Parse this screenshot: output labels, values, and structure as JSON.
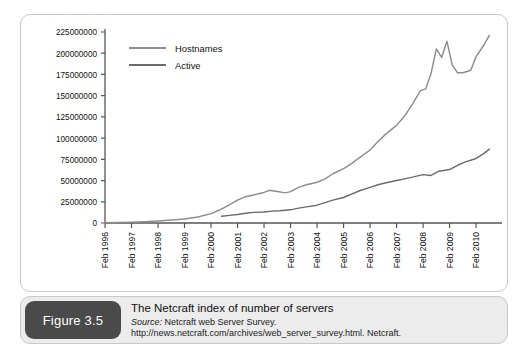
{
  "figure": {
    "badge_label": "Figure 3.5",
    "title": "The Netcraft index of number of servers",
    "source_label": "Source:",
    "source_text": " Netcraft web Server Survey. http://news.netcraft.com/archives/web_server_survey.html. Netcraft."
  },
  "colors": {
    "hostnames_line": "#8d8d8d",
    "active_line": "#6b6b6b",
    "axis": "#555555",
    "panel_border": "#c8c8c8",
    "badge_bg": "#4a4a4a",
    "caption_bg": "#ececec",
    "text": "#1a1a1a"
  },
  "chart_data": {
    "type": "line",
    "title": "The Netcraft index of number of servers",
    "xlabel": "",
    "ylabel": "",
    "grid": false,
    "legend_position": "top-left",
    "ylim": [
      0,
      225000000
    ],
    "yticks": [
      0,
      25000000,
      50000000,
      75000000,
      100000000,
      125000000,
      150000000,
      175000000,
      200000000,
      225000000
    ],
    "ytick_labels": [
      "0",
      "25000000",
      "50000000",
      "75000000",
      "100000000",
      "125000000",
      "150000000",
      "175000000",
      "200000000",
      "225000000"
    ],
    "xticks": [
      "Feb 1996",
      "Feb 1997",
      "Feb 1998",
      "Feb 1999",
      "Feb 2000",
      "Feb 2001",
      "Feb 2002",
      "Feb 2003",
      "Feb 2004",
      "Feb 2005",
      "Feb 2006",
      "Feb 2007",
      "Feb 2008",
      "Feb 2009",
      "Feb 2010"
    ],
    "xlim": [
      "Feb 1996",
      "Aug 2010"
    ],
    "series": [
      {
        "name": "Hostnames",
        "color": "#8d8d8d",
        "x": [
          1996.1,
          1996.6,
          1997.1,
          1997.6,
          1998.1,
          1998.6,
          1999.1,
          1999.6,
          2000.1,
          2000.4,
          2000.7,
          2001.1,
          2001.4,
          2001.7,
          2002.1,
          2002.3,
          2002.6,
          2002.9,
          2003.1,
          2003.4,
          2003.7,
          2004.1,
          2004.4,
          2004.7,
          2005.1,
          2005.4,
          2005.7,
          2006.1,
          2006.4,
          2006.7,
          2007.1,
          2007.4,
          2007.7,
          2008.0,
          2008.2,
          2008.4,
          2008.6,
          2008.8,
          2009.0,
          2009.2,
          2009.4,
          2009.6,
          2009.9,
          2010.1,
          2010.4,
          2010.6
        ],
        "values": [
          200000,
          500000,
          1000000,
          1600000,
          2400000,
          3500000,
          4800000,
          7000000,
          11000000,
          15000000,
          20000000,
          27000000,
          31000000,
          33000000,
          36000000,
          38500000,
          37000000,
          35500000,
          37000000,
          42000000,
          45000000,
          48000000,
          52000000,
          58000000,
          64000000,
          70000000,
          77000000,
          86000000,
          96000000,
          105000000,
          115000000,
          126000000,
          140000000,
          156000000,
          158000000,
          176000000,
          205000000,
          195000000,
          214000000,
          186000000,
          177000000,
          177000000,
          180000000,
          196000000,
          210000000,
          221000000
        ]
      },
      {
        "name": "Active",
        "color": "#6b6b6b",
        "x": [
          2000.5,
          2000.8,
          2001.1,
          2001.4,
          2001.7,
          2002.1,
          2002.4,
          2002.7,
          2003.1,
          2003.4,
          2003.7,
          2004.1,
          2004.4,
          2004.7,
          2005.1,
          2005.4,
          2005.7,
          2006.1,
          2006.4,
          2006.7,
          2007.1,
          2007.4,
          2007.7,
          2008.1,
          2008.4,
          2008.7,
          2009.1,
          2009.4,
          2009.7,
          2010.1,
          2010.4,
          2010.6
        ],
        "values": [
          8000000,
          9000000,
          10000000,
          11500000,
          12500000,
          13000000,
          14000000,
          14500000,
          15500000,
          17500000,
          19000000,
          21000000,
          24000000,
          27000000,
          30000000,
          34000000,
          38000000,
          42000000,
          45000000,
          47500000,
          50000000,
          52000000,
          54000000,
          57000000,
          56000000,
          61000000,
          63000000,
          68000000,
          72000000,
          76000000,
          82000000,
          87000000
        ]
      }
    ]
  }
}
